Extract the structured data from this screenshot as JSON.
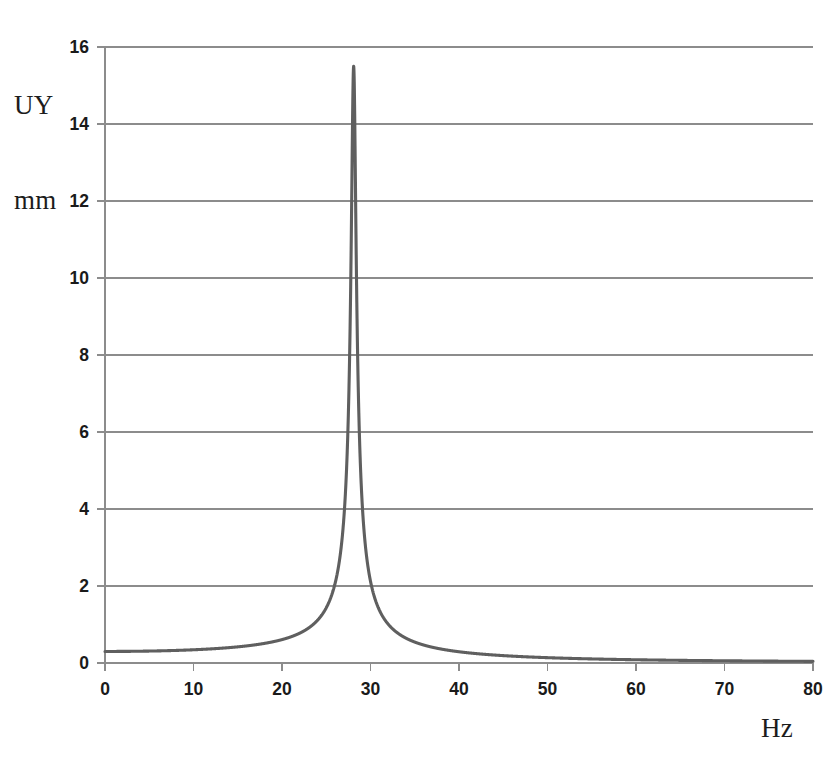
{
  "figure": {
    "y_axis_label_lines": [
      "UY",
      "mm"
    ],
    "x_axis_label": "Hz",
    "curve_color": "#5f5f5f",
    "grid_color": "#8c8c8c",
    "axis_color": "#8c8c8c",
    "text_color": "#1a1a1a",
    "background": "#ffffff"
  },
  "chart_data": {
    "type": "line",
    "title": "",
    "subtitle": "",
    "xlabel": "Hz",
    "ylabel": "UY mm",
    "xlim": [
      0,
      80
    ],
    "ylim": [
      0,
      16
    ],
    "xticks": [
      0,
      10,
      20,
      30,
      40,
      50,
      60,
      70,
      80
    ],
    "yticks": [
      0,
      2,
      4,
      6,
      8,
      10,
      12,
      14,
      16
    ],
    "xtick_labels": [
      "0",
      "10",
      "20",
      "30",
      "40",
      "50",
      "60",
      "70",
      "80"
    ],
    "ytick_labels": [
      "0",
      "2",
      "4",
      "6",
      "8",
      "10",
      "12",
      "14",
      "16"
    ],
    "grid": "horizontal",
    "legend": null,
    "annotations": [],
    "series": [
      {
        "name": "UY amplitude",
        "resonance_frequency_hz": 28.1,
        "peak_value_mm": 15.5,
        "static_value_mm": 0.3,
        "x": [
          0,
          1,
          2,
          3,
          4,
          5,
          6,
          7,
          8,
          9,
          10,
          11,
          12,
          13,
          14,
          15,
          16,
          17,
          18,
          19,
          20,
          21,
          22,
          23,
          24,
          25,
          26,
          26.5,
          27,
          27.3,
          27.6,
          27.8,
          28,
          28.1,
          28.2,
          28.4,
          28.6,
          28.9,
          29.2,
          29.6,
          30,
          30.5,
          31,
          32,
          33,
          34,
          35,
          36,
          37,
          38,
          39,
          40,
          42,
          44,
          46,
          48,
          50,
          55,
          60,
          65,
          70,
          75,
          80
        ],
        "y": [
          0.3,
          0.3,
          0.3,
          0.3,
          0.31,
          0.31,
          0.32,
          0.33,
          0.34,
          0.35,
          0.37,
          0.39,
          0.41,
          0.44,
          0.47,
          0.51,
          0.56,
          0.62,
          0.7,
          0.8,
          0.94,
          1.12,
          1.38,
          1.76,
          2.38,
          3.5,
          6.0,
          8.3,
          12.3,
          14.6,
          15.4,
          15.52,
          15.5,
          15.48,
          15.3,
          14.2,
          12.3,
          9.0,
          6.4,
          4.3,
          3.1,
          2.2,
          1.7,
          1.15,
          0.87,
          0.69,
          0.58,
          0.5,
          0.43,
          0.38,
          0.34,
          0.31,
          0.26,
          0.22,
          0.19,
          0.17,
          0.15,
          0.12,
          0.095,
          0.08,
          0.07,
          0.06,
          0.055
        ]
      }
    ]
  }
}
